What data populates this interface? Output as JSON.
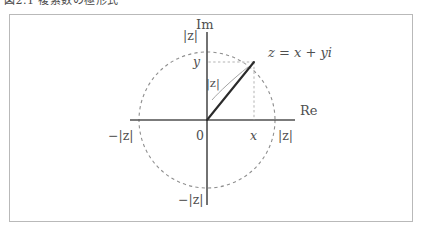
{
  "document": {
    "caption_fragment": "図2.1  複素数の極形式"
  },
  "figure": {
    "name": "complex-plane-modulus-diagram",
    "background": "#ffffff",
    "frame_color": "#b9b9b9",
    "axis_color": "#4f4f4f",
    "circle_color": "#8f8f8f",
    "vector_color": "#2b2b2b",
    "helper_color": "#b3b3b3",
    "leader_color": "#9a9a9a",
    "axes": {
      "imaginary_label": "Im",
      "real_label": "Re",
      "origin_label": "0"
    },
    "ticks": {
      "top": "|z|",
      "bottom": "−|z|",
      "left": "−|z|",
      "right": "|z|"
    },
    "point": {
      "label": "z = x + yi",
      "x_label": "x",
      "y_label": "y"
    },
    "vector": {
      "label": "|z|"
    },
    "geometry": {
      "center_x": 207,
      "center_y": 120,
      "radius": 68,
      "point_x": 254,
      "point_y": 62,
      "axis_left": 130,
      "axis_right": 295,
      "axis_top": 32,
      "axis_bottom": 205
    }
  }
}
